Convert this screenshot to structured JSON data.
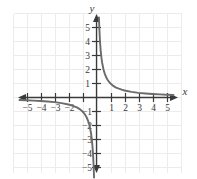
{
  "chart_data": {
    "type": "line",
    "title": "",
    "subtitle": "",
    "xlabel": "x",
    "ylabel": "y",
    "xlim": [
      -5.9,
      5.9
    ],
    "ylim": [
      -5.9,
      5.9
    ],
    "grid": true,
    "grid_step": 1,
    "legend": "none",
    "function": "y = 1/x",
    "asymptotes": {
      "vertical": 0,
      "horizontal": 0
    },
    "x_ticks": [
      -5,
      -4,
      -3,
      -2,
      -1,
      1,
      2,
      3,
      4,
      5
    ],
    "y_ticks": [
      -5,
      -4,
      -3,
      -2,
      -1,
      1,
      2,
      3,
      4,
      5
    ],
    "x_tick_labels": [
      "−5",
      "−4",
      "−3",
      "−2",
      "",
      "1",
      "2",
      "3",
      "4",
      "5"
    ],
    "y_tick_labels": [
      "−5",
      "−4",
      "−3",
      "−2",
      "−1",
      "1",
      "2",
      "3",
      "4",
      "5"
    ],
    "series": [
      {
        "name": "branch-positive",
        "x": [
          0.175,
          0.2,
          0.25,
          0.3,
          0.35,
          0.4,
          0.5,
          0.6,
          0.7,
          0.8,
          0.9,
          1.0,
          1.2,
          1.4,
          1.6,
          1.8,
          2.0,
          2.5,
          3.0,
          3.5,
          4.0,
          4.5,
          5.0,
          5.5
        ],
        "y": [
          5.71,
          5.0,
          4.0,
          3.33,
          2.86,
          2.5,
          2.0,
          1.67,
          1.43,
          1.25,
          1.11,
          1.0,
          0.83,
          0.71,
          0.63,
          0.56,
          0.5,
          0.4,
          0.33,
          0.29,
          0.25,
          0.22,
          0.2,
          0.18
        ]
      },
      {
        "name": "branch-negative",
        "x": [
          -5.5,
          -5.0,
          -4.5,
          -4.0,
          -3.5,
          -3.0,
          -2.5,
          -2.0,
          -1.8,
          -1.6,
          -1.4,
          -1.2,
          -1.0,
          -0.9,
          -0.8,
          -0.7,
          -0.6,
          -0.5,
          -0.4,
          -0.35,
          -0.3,
          -0.25,
          -0.2,
          -0.175
        ],
        "y": [
          -0.18,
          -0.2,
          -0.22,
          -0.25,
          -0.29,
          -0.33,
          -0.4,
          -0.5,
          -0.56,
          -0.63,
          -0.71,
          -0.83,
          -1.0,
          -1.11,
          -1.25,
          -1.43,
          -1.67,
          -2.0,
          -2.5,
          -2.86,
          -3.33,
          -4.0,
          -5.0,
          -5.71
        ]
      }
    ],
    "colors": {
      "curve": "#6b6b6b",
      "axis": "#3a3a3a",
      "grid": "#ececec",
      "background": "#ffffff",
      "label": "#3a3a3a"
    }
  }
}
